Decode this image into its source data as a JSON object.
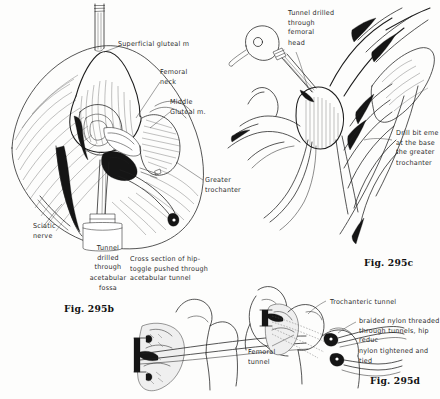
{
  "page": {
    "background_color": "#fdfdfc",
    "ink_color": "#1d1d1d"
  },
  "panels": [
    {
      "id": "panel-b",
      "caption": "Fig. 295b",
      "subject": "Surgical exposure of the hip joint with drill passing through the acetabular fossa",
      "labels": [
        {
          "name": "superficial-gluteal-muscle",
          "text": "Superficial gluteal m"
        },
        {
          "name": "femoral-neck",
          "text": "Femoral\nneck"
        },
        {
          "name": "middle-gluteal-muscle",
          "text": "Middle\nGluteal  m."
        },
        {
          "name": "greater-trochanter",
          "text": "Greater\ntrochanter"
        },
        {
          "name": "sciatic-nerve",
          "text": "Sciatic\nnerve"
        },
        {
          "name": "acetabular-tunnel",
          "text": "Tunnel\ndrilled\nthrough\nacetabular\nfossa"
        }
      ]
    },
    {
      "id": "panel-c",
      "caption": "Fig. 295c",
      "subject": "Drill passing through the femoral head and neck, bit emerging at the greater trochanter",
      "labels": [
        {
          "name": "femoral-head-tunnel",
          "text": "Tunnel drilled\nthrough\nfemoral\nhead"
        },
        {
          "name": "drill-bit-emerging",
          "text": "Drill bit eme\nat the base\nthe greater\ntrochanter"
        }
      ]
    },
    {
      "id": "panel-cross-section",
      "caption": "",
      "subject": "Cross section of the hip with toggle pushed through the acetabular tunnel",
      "labels": [
        {
          "name": "cross-section-note",
          "text": "Cross section of hip-\ntoggle pushed through\nacetabular tunnel"
        }
      ]
    },
    {
      "id": "panel-d",
      "caption": "Fig. 295d",
      "subject": "Braided nylon threaded through femoral and trochanteric tunnels, hip reduced and nylon tied",
      "labels": [
        {
          "name": "trochanteric-tunnel",
          "text": "Trochanteric  tunnel"
        },
        {
          "name": "femoral-tunnel",
          "text": "Femoral\ntunnel"
        },
        {
          "name": "nylon-note",
          "text": "braided nylon threaded\nthrough tunnels, hip reduc\nnylon tightened and tied"
        }
      ]
    }
  ]
}
